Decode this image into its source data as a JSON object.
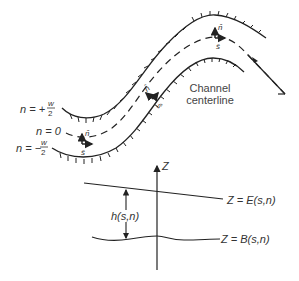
{
  "diagram": {
    "type": "channel-coordinate-system",
    "colors": {
      "line": "#222222",
      "text": "#333333",
      "background": "#ffffff"
    },
    "plan_view": {
      "bank_labels": {
        "outer": {
          "lhs": "n = +",
          "num": "w",
          "den": "2"
        },
        "center": {
          "lhs": "n = 0"
        },
        "inner": {
          "lhs": "n = −",
          "num": "w",
          "den": "2"
        }
      },
      "unit_vectors": {
        "n_hat": "n̂",
        "s_hat": "ŝ"
      },
      "callout": {
        "line1": "Channel",
        "line2": "centerline"
      }
    },
    "section_view": {
      "axis_label": "Z",
      "depth_label": "h(s,n)",
      "water_surface_label": "Z = E(s,n)",
      "bed_label": "Z = B(s,n)"
    }
  }
}
